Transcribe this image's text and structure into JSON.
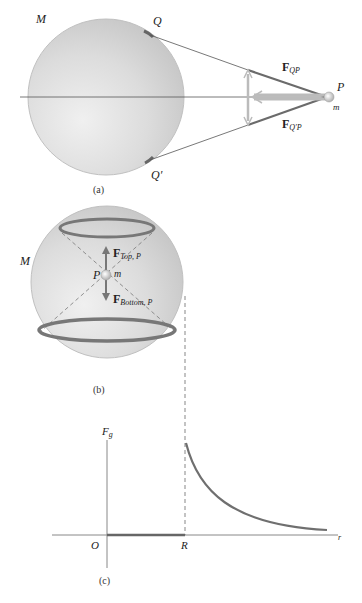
{
  "panel_a": {
    "caption": "(a)",
    "mass_label": "M",
    "point_q": "Q",
    "point_q_prime": "Q′",
    "point_p": "P",
    "small_mass": "m",
    "force_qp": {
      "main": "F",
      "sub": "QP"
    },
    "force_q_prime_p": {
      "main": "F",
      "sub": "Q′P"
    }
  },
  "panel_b": {
    "caption": "(b)",
    "mass_label": "M",
    "point_p": "P",
    "small_mass": "m",
    "force_top": {
      "main": "F",
      "sub": "Top, P"
    },
    "force_bottom": {
      "main": "F",
      "sub": "Bottom, P"
    }
  },
  "panel_c": {
    "caption": "(c)",
    "y_axis_label": "F",
    "y_axis_sub": "g",
    "x_axis_label": "r",
    "origin_label": "O",
    "radius_label": "R"
  },
  "colors": {
    "sphere": "#d4d4d4",
    "force_line": "#6b6b6b",
    "ring": "#7a7a7a",
    "curve": "#707070",
    "axis": "#888888"
  }
}
